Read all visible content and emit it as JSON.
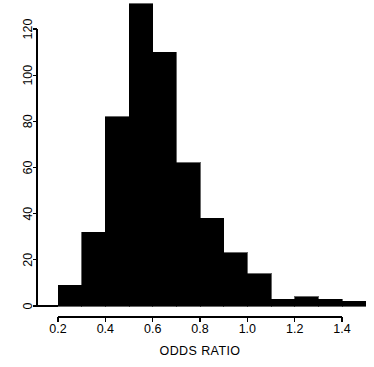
{
  "chart_data": {
    "type": "bar",
    "title": "",
    "subtitle": "",
    "xlabel": "ODDS RATIO",
    "ylabel": "",
    "grid": false,
    "legend": null,
    "legend_position": "none",
    "bin_width": 0.1,
    "bar_color": "#000000",
    "axis_color": "#000000",
    "background_color": "#FFFFFF",
    "xlim": [
      0.15,
      1.5
    ],
    "ylim": [
      0,
      131
    ],
    "xticks": [
      0.2,
      0.4,
      0.6,
      0.8,
      1.0,
      1.2,
      1.4
    ],
    "xtick_labels": [
      "0.2",
      "0.4",
      "0.6",
      "0.8",
      "1.0",
      "1.2",
      "1.4"
    ],
    "yticks": [
      0,
      20,
      40,
      60,
      80,
      100,
      120
    ],
    "ytick_labels": [
      "0",
      "20",
      "40",
      "60",
      "80",
      "100",
      "120"
    ],
    "bin_edges": [
      0.2,
      0.3,
      0.4,
      0.5,
      0.6,
      0.7,
      0.8,
      0.9,
      1.0,
      1.1,
      1.2,
      1.3,
      1.4,
      1.5
    ],
    "categories": [
      "0.2-0.3",
      "0.3-0.4",
      "0.4-0.5",
      "0.5-0.6",
      "0.6-0.7",
      "0.7-0.8",
      "0.8-0.9",
      "0.9-1.0",
      "1.0-1.1",
      "1.1-1.2",
      "1.2-1.3",
      "1.3-1.4",
      "1.4-1.5"
    ],
    "values": [
      9,
      32,
      82,
      131,
      110,
      62,
      38,
      23,
      14,
      3,
      4,
      3,
      2
    ],
    "bars": [
      {
        "x0": 0.2,
        "x1": 0.3,
        "count": 9
      },
      {
        "x0": 0.3,
        "x1": 0.4,
        "count": 32
      },
      {
        "x0": 0.4,
        "x1": 0.5,
        "count": 82
      },
      {
        "x0": 0.5,
        "x1": 0.6,
        "count": 131
      },
      {
        "x0": 0.6,
        "x1": 0.7,
        "count": 110
      },
      {
        "x0": 0.7,
        "x1": 0.8,
        "count": 62
      },
      {
        "x0": 0.8,
        "x1": 0.9,
        "count": 38
      },
      {
        "x0": 0.9,
        "x1": 1.0,
        "count": 23
      },
      {
        "x0": 1.0,
        "x1": 1.1,
        "count": 14
      },
      {
        "x0": 1.1,
        "x1": 1.2,
        "count": 3
      },
      {
        "x0": 1.2,
        "x1": 1.3,
        "count": 4
      },
      {
        "x0": 1.3,
        "x1": 1.4,
        "count": 3
      },
      {
        "x0": 1.4,
        "x1": 1.5,
        "count": 2
      }
    ]
  }
}
